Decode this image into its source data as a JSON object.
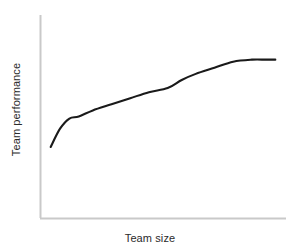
{
  "chart_data": {
    "type": "line",
    "title": "",
    "subtitle": "",
    "xlabel": "Team size",
    "ylabel": "Team performance",
    "grid": false,
    "legend": false,
    "legend_position": "none",
    "axis_ticks": false,
    "tick_labels_x": [],
    "tick_labels_y": [],
    "xlim": [
      0,
      1
    ],
    "ylim": [
      0,
      1
    ],
    "annotations": [],
    "series": [
      {
        "name": "Team performance vs team size",
        "description": "Monotonically increasing curve with diminishing returns that saturates at a plateau",
        "x": [
          0.02,
          0.06,
          0.1,
          0.14,
          0.2,
          0.28,
          0.36,
          0.44,
          0.52,
          0.58,
          0.64,
          0.72,
          0.8,
          0.88,
          0.94,
          0.98
        ],
        "y": [
          0.35,
          0.44,
          0.49,
          0.5,
          0.53,
          0.56,
          0.59,
          0.62,
          0.64,
          0.68,
          0.71,
          0.74,
          0.77,
          0.78,
          0.78,
          0.78
        ]
      }
    ],
    "colors": {
      "curve": "#1a1a1a",
      "axis": "#c9c9c9",
      "text": "#2b2b2b",
      "background": "#ffffff"
    }
  }
}
